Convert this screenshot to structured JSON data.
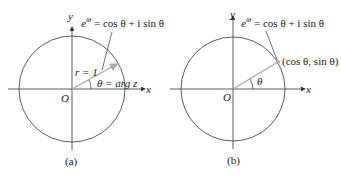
{
  "panels": [
    {
      "caption": "(a)",
      "x_axis_label": "x",
      "y_axis_label": "y",
      "origin_label": "O",
      "formula": {
        "e": "e",
        "exp": "iθ",
        "rest": " = cos θ + i sin θ"
      },
      "radius_label": "r = 1",
      "angle_label": "θ  = arg z"
    },
    {
      "caption": "(b)",
      "x_axis_label": "x",
      "y_axis_label": "y",
      "origin_label": "O",
      "formula": {
        "e": "e",
        "exp": "iθ",
        "rest": " = cos θ + i sin θ"
      },
      "point_label": "(cos θ, sin θ)",
      "angle_label": "θ"
    }
  ],
  "colors": {
    "stroke": "#333333",
    "vector": "#b8b8b8"
  }
}
